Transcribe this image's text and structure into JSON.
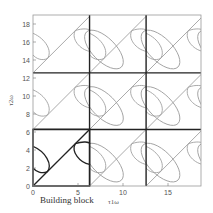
{
  "chart_data": {
    "type": "diagram",
    "title": "",
    "xlabel": "τ1ω",
    "ylabel": "τ2ω",
    "xlim": [
      0,
      19
    ],
    "ylim": [
      0,
      19
    ],
    "x_ticks": [
      "0",
      "5",
      "10",
      "15"
    ],
    "y_ticks": [
      "0",
      "2",
      "4",
      "6",
      "8",
      "10",
      "12",
      "14",
      "16",
      "18"
    ],
    "grid": false,
    "period": 6.2832,
    "tiling": "3x3 periodic tiles of the 2π×2π building block",
    "building_block": {
      "label": "Building block",
      "x_range": [
        0,
        6.2832
      ],
      "y_range": [
        0,
        6.2832
      ],
      "diagonal": [
        [
          0,
          0
        ],
        [
          6.2832,
          6.2832
        ]
      ],
      "left_arc": {
        "from": [
          0,
          4.4
        ],
        "to": [
          1.6,
          1.6
        ],
        "end": [
          0,
          2.0
        ]
      },
      "right_arc": {
        "from": [
          4.8,
          4.8
        ],
        "to": [
          6.2832,
          2.4
        ]
      }
    },
    "styles": {
      "block_color": "#222222",
      "tile_color": "#a0a0a0",
      "boundary_color": "#222222"
    }
  },
  "labels": {
    "caption": "Building block",
    "xlabel": "τ1ω",
    "ylabel": "τ2ω"
  }
}
